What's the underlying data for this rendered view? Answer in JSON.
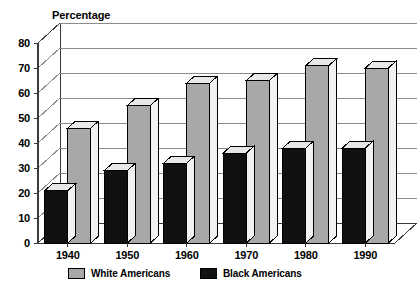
{
  "chart_data": {
    "type": "bar",
    "title": "",
    "xlabel": "",
    "ylabel": "Percentage",
    "ylim": [
      0,
      80
    ],
    "yticks": [
      0,
      10,
      20,
      30,
      40,
      50,
      60,
      70,
      80
    ],
    "ytick_labels": [
      "0",
      "10",
      "20",
      "30",
      "40",
      "50",
      "60",
      "70",
      "80"
    ],
    "grid": true,
    "legend_position": "bottom",
    "style": "3d-grouped-bar",
    "categories": [
      "1940",
      "1950",
      "1960",
      "1970",
      "1980",
      "1990"
    ],
    "series": [
      {
        "name": "White Americans",
        "color": "#a8a8a8",
        "values": [
          46,
          55,
          64,
          65,
          71,
          70
        ]
      },
      {
        "name": "Black Americans",
        "color": "#111111",
        "values": [
          21,
          29,
          32,
          36,
          38,
          38
        ]
      }
    ]
  },
  "axis": {
    "y_title": "Percentage"
  },
  "legend": {
    "items": [
      {
        "label": "White Americans",
        "swatch": "#a8a8a8"
      },
      {
        "label": "Black Americans",
        "swatch": "#111111"
      }
    ]
  },
  "colors": {
    "white_series": "#a8a8a8",
    "black_series": "#111111",
    "bar_top_highlight": "#e8e8e8",
    "axis_line": "#3a3a3a",
    "grid_line": "#8c8c8c",
    "background": "#ffffff"
  }
}
